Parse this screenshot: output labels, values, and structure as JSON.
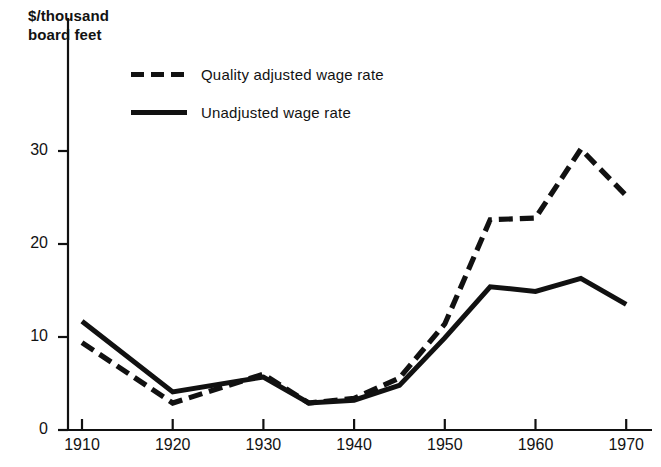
{
  "chart_data": {
    "type": "line",
    "title": "",
    "xlabel": "",
    "ylabel": "$/thousand board feet",
    "ylabel_lines": [
      "$/thousand",
      "board feet"
    ],
    "x": [
      1910,
      1920,
      1930,
      1935,
      1940,
      1945,
      1950,
      1955,
      1960,
      1965,
      1970
    ],
    "xlim": [
      1908,
      1972
    ],
    "ylim": [
      0,
      33
    ],
    "grid": false,
    "legend_position": "top-center",
    "xticks": [
      1910,
      1920,
      1930,
      1940,
      1950,
      1960,
      1970
    ],
    "xtick_labels": [
      "1910",
      "1920",
      "1930",
      "1940",
      "1950",
      "1960",
      "1970"
    ],
    "yticks": [
      0,
      10,
      20,
      30
    ],
    "ytick_labels": [
      "0",
      "10",
      "20",
      "30"
    ],
    "series": [
      {
        "name": "Quality adjusted wage rate",
        "style": "dashed",
        "color": "#111111",
        "values": [
          9.4,
          2.9,
          6.0,
          2.9,
          3.4,
          5.6,
          11.4,
          22.6,
          22.8,
          30.2,
          25.2
        ]
      },
      {
        "name": "Unadjusted wage rate",
        "style": "solid",
        "color": "#111111",
        "values": [
          11.7,
          4.1,
          5.7,
          2.9,
          3.2,
          4.8,
          9.9,
          15.4,
          14.9,
          16.3,
          13.5
        ]
      }
    ]
  },
  "legend": {
    "items": [
      {
        "label": "Quality adjusted wage rate",
        "style": "dashed"
      },
      {
        "label": "Unadjusted wage rate",
        "style": "solid"
      }
    ]
  },
  "colors": {
    "ink": "#111111",
    "background": "#ffffff"
  }
}
